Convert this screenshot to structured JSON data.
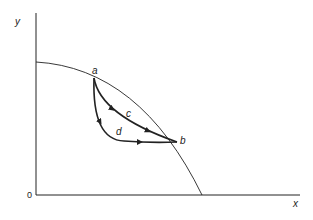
{
  "diagram": {
    "axes": {
      "x_label": "x",
      "y_label": "y",
      "origin_label": "0"
    },
    "points": {
      "a": "a",
      "b": "b"
    },
    "paths": {
      "c": "c",
      "d": "d"
    },
    "colors": {
      "stroke": "#222222",
      "background": "#ffffff"
    }
  }
}
